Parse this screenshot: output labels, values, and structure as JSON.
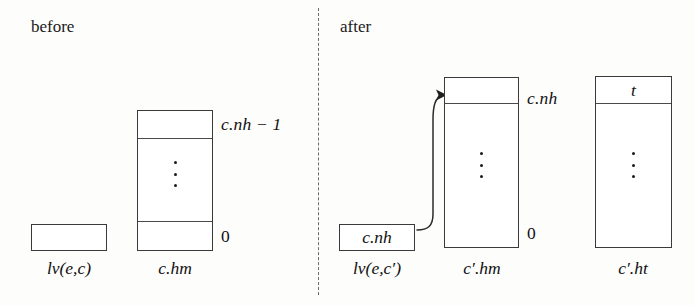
{
  "figure": {
    "type": "diagram",
    "sections": [
      {
        "id": "before",
        "label": "before"
      },
      {
        "id": "after",
        "label": "after"
      }
    ],
    "separator": {
      "name": "dashed-vertical-divider",
      "style": "dashed"
    }
  },
  "before": {
    "label": "before",
    "local_var_box": {
      "caption": "lv(e,c)",
      "value": ""
    },
    "heap_block": {
      "caption": "c.hm",
      "top_index_label": "c.nh − 1",
      "bottom_index_label": "0",
      "ellipsis": "⋮",
      "cells": [
        {
          "value": ""
        },
        {
          "value": ""
        }
      ]
    }
  },
  "after": {
    "label": "after",
    "local_var_box": {
      "caption": "lv(e,c′)",
      "value": "c.nh"
    },
    "heap_block": {
      "caption": "c′.hm",
      "top_index_label": "c.nh",
      "bottom_index_label": "0",
      "ellipsis": "⋮",
      "cells": [
        {
          "value": ""
        },
        {
          "value": ""
        }
      ]
    },
    "table_block": {
      "caption": "c′.ht",
      "top_cell_value": "t",
      "ellipsis": "⋮",
      "cells": [
        {
          "value": "t"
        },
        {
          "value": ""
        }
      ]
    },
    "pointer_arrow": {
      "name": "pointer-arrow",
      "from": "lv(e,c′)",
      "to": "c′.hm top cell"
    }
  },
  "colors": {
    "background": "#fdfdfc",
    "stroke": "#3a3a3a",
    "text": "#111111",
    "divider": "#6a6a6a"
  }
}
